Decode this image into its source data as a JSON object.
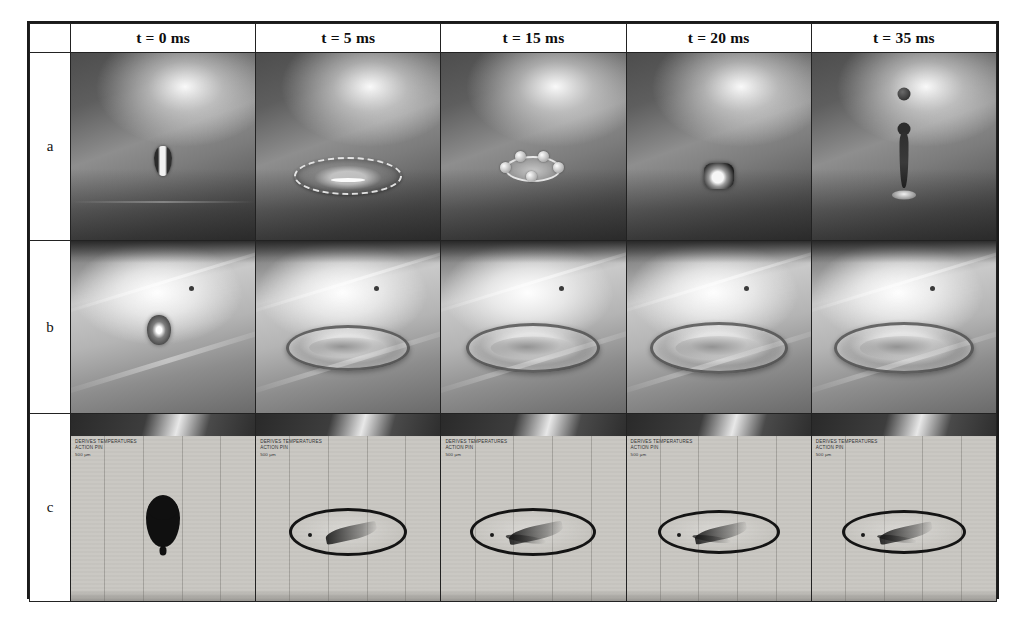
{
  "figure": {
    "row_header_label": "",
    "columns": [
      {
        "id": "t0",
        "label": "t = 0 ms",
        "time_ms": 0
      },
      {
        "id": "t5",
        "label": "t = 5 ms",
        "time_ms": 5
      },
      {
        "id": "t15",
        "label": "t = 15 ms",
        "time_ms": 15
      },
      {
        "id": "t20",
        "label": "t = 20 ms",
        "time_ms": 20
      },
      {
        "id": "t35",
        "label": "t = 35 ms",
        "time_ms": 35
      }
    ],
    "rows": [
      {
        "id": "a",
        "label": "a",
        "description": "dark backlit side view, droplet impact, spreading lamella, receding, Worthington jet with satellite droplet"
      },
      {
        "id": "b",
        "label": "b",
        "description": "bright illuminated view, droplet impact forming persistent spread ring"
      },
      {
        "id": "c",
        "label": "c",
        "description": "shadowgraph silhouette view with instrument overlay text and vertical scale rules"
      }
    ],
    "overlay": {
      "line1": "DERIVES TEMPERATURES",
      "line2": "ACTION PIN",
      "line3": "500 µm"
    },
    "colors": {
      "border": "#1a1a1a",
      "page_background": "#ffffff",
      "row_a_background": "#5e5e5e",
      "row_b_background": "#b4b4b4",
      "row_c_background": "#c9c7c2",
      "droplet_dark": "#101010"
    }
  }
}
